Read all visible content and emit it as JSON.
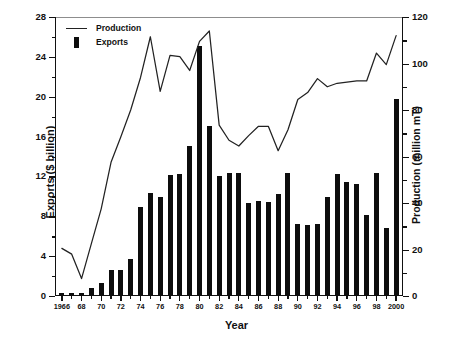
{
  "chart_data": {
    "type": "bar",
    "title": "",
    "xlabel": "Year",
    "ylabel": "Exports ($ billion)",
    "y2label": "Production (million mT)",
    "grid": false,
    "legend_position": "top-left",
    "ylim": [
      0,
      28
    ],
    "y2lim": [
      0,
      120
    ],
    "xlim": [
      1965.3,
      2000.7
    ],
    "yticks": [
      0,
      4,
      8,
      12,
      16,
      20,
      24,
      28
    ],
    "yticklabels": [
      "0",
      "4",
      "8",
      "12",
      "16",
      "20",
      "24",
      "28"
    ],
    "yminorticks": [
      2,
      6,
      10,
      14,
      18,
      22,
      26
    ],
    "y2ticks": [
      0,
      20,
      40,
      60,
      80,
      100,
      120
    ],
    "y2ticklabels": [
      "0",
      "20",
      "40",
      "60",
      "80",
      "100",
      "120"
    ],
    "y2minorticks": [
      10,
      30,
      50,
      70,
      90,
      110
    ],
    "categories": [
      1966,
      1967,
      1968,
      1969,
      1970,
      1971,
      1972,
      1973,
      1974,
      1975,
      1976,
      1977,
      1978,
      1979,
      1980,
      1981,
      1982,
      1983,
      1984,
      1985,
      1986,
      1987,
      1988,
      1989,
      1990,
      1991,
      1992,
      1993,
      1994,
      1995,
      1996,
      1997,
      1998,
      1999,
      2000
    ],
    "xticklabels": [
      "1966",
      "",
      "68",
      "",
      "70",
      "",
      "72",
      "",
      "74",
      "",
      "76",
      "",
      "78",
      "",
      "80",
      "",
      "82",
      "",
      "84",
      "",
      "86",
      "",
      "88",
      "",
      "90",
      "",
      "92",
      "",
      "94",
      "",
      "96",
      "",
      "98",
      "",
      "2000"
    ],
    "series": [
      {
        "name": "Exports",
        "kind": "bar",
        "axis": "left",
        "units": "$ billion",
        "color": "#0d0d0d",
        "values": [
          0.3,
          0.3,
          0.3,
          0.8,
          1.3,
          2.6,
          2.6,
          3.7,
          8.9,
          10.3,
          9.9,
          12.1,
          12.2,
          15.1,
          25.1,
          17.1,
          12.0,
          12.3,
          12.3,
          9.3,
          9.5,
          9.4,
          10.2,
          12.3,
          7.2,
          7.1,
          7.2,
          9.9,
          12.2,
          11.4,
          11.2,
          8.1,
          12.3,
          6.8,
          19.8
        ]
      },
      {
        "name": "Production",
        "kind": "line",
        "axis": "right",
        "units": "million mT",
        "color": "#222222",
        "values": [
          20.5,
          18.0,
          7.5,
          22.5,
          37.5,
          57.5,
          68.5,
          80.0,
          94.0,
          111.5,
          88.0,
          103.5,
          103.0,
          97.0,
          109.5,
          114.0,
          73.5,
          67.0,
          64.5,
          69.0,
          73.0,
          73.0,
          62.5,
          71.5,
          84.5,
          87.5,
          93.5,
          90.0,
          91.5,
          92.0,
          92.5,
          92.5,
          104.5,
          99.5,
          112.0
        ]
      }
    ]
  },
  "legend": {
    "items": [
      {
        "label": "Production",
        "marker": "line"
      },
      {
        "label": "Exports",
        "marker": "bar"
      }
    ]
  }
}
